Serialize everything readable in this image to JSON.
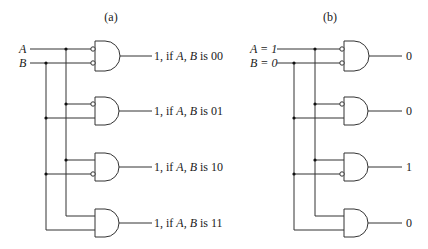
{
  "panels": [
    {
      "id": "a",
      "caption": "(a)",
      "inputs": [
        {
          "label": "A"
        },
        {
          "label": "B"
        }
      ],
      "outputs": [
        {
          "prefix": "1, if ",
          "vars": "A, B",
          "mid": " is ",
          "code": "00"
        },
        {
          "prefix": "1, if ",
          "vars": "A, B",
          "mid": " is ",
          "code": "01"
        },
        {
          "prefix": "1, if ",
          "vars": "A, B",
          "mid": " is ",
          "code": "10"
        },
        {
          "prefix": "1, if ",
          "vars": "A, B",
          "mid": " is ",
          "code": "11"
        }
      ]
    },
    {
      "id": "b",
      "caption": "(b)",
      "inputs": [
        {
          "label": "A = 1"
        },
        {
          "label": "B = 0"
        }
      ],
      "outputs": [
        {
          "value": "0"
        },
        {
          "value": "0"
        },
        {
          "value": "1"
        },
        {
          "value": "0"
        }
      ]
    }
  ],
  "gates": [
    {
      "type": "AND",
      "invert_a": true,
      "invert_b": true
    },
    {
      "type": "AND",
      "invert_a": true,
      "invert_b": false
    },
    {
      "type": "AND",
      "invert_a": false,
      "invert_b": true
    },
    {
      "type": "AND",
      "invert_a": false,
      "invert_b": false
    }
  ]
}
